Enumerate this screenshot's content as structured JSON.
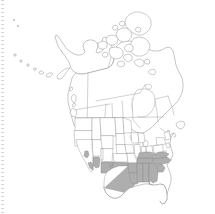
{
  "figure": {
    "title": "North America distribution map",
    "caption": "",
    "background_color": "#ffffff",
    "outline_color": "#8c8c8c",
    "boundary_color": "#9a9a9a",
    "shade_color": "#aeaeae",
    "width_px": 215,
    "height_px": 214
  },
  "map": {
    "projection": "conic",
    "extent": "North America",
    "has_legend": false,
    "has_labels": false,
    "has_scalebar": false,
    "has_graticule": false,
    "regions_shown": [
      "Alaska",
      "Canada",
      "Contiguous United States"
    ],
    "shaded_meaning": "occurrence",
    "shaded_regions": [
      "Texas",
      "Oklahoma",
      "Arkansas",
      "Louisiana",
      "Mississippi",
      "Alabama",
      "Georgia",
      "Florida",
      "South Carolina",
      "North Carolina",
      "Tennessee",
      "Kentucky",
      "Virginia",
      "Arizona",
      "New Mexico",
      "California"
    ],
    "unshaded_regions": [
      "Washington",
      "Oregon",
      "Idaho",
      "Nevada",
      "Utah",
      "Montana",
      "Wyoming",
      "Colorado",
      "North Dakota",
      "South Dakota",
      "Nebraska",
      "Kansas",
      "Minnesota",
      "Iowa",
      "Missouri",
      "Wisconsin",
      "Illinois",
      "Michigan",
      "Indiana",
      "Ohio",
      "West Virginia",
      "Pennsylvania",
      "New York",
      "Maine",
      "British Columbia",
      "Alberta",
      "Saskatchewan",
      "Manitoba",
      "Ontario",
      "Quebec",
      "Newfoundland and Labrador",
      "Yukon",
      "Northwest Territories",
      "Nunavut"
    ]
  },
  "artifacts": {
    "left_edge_marks": "dotted scan edge"
  }
}
